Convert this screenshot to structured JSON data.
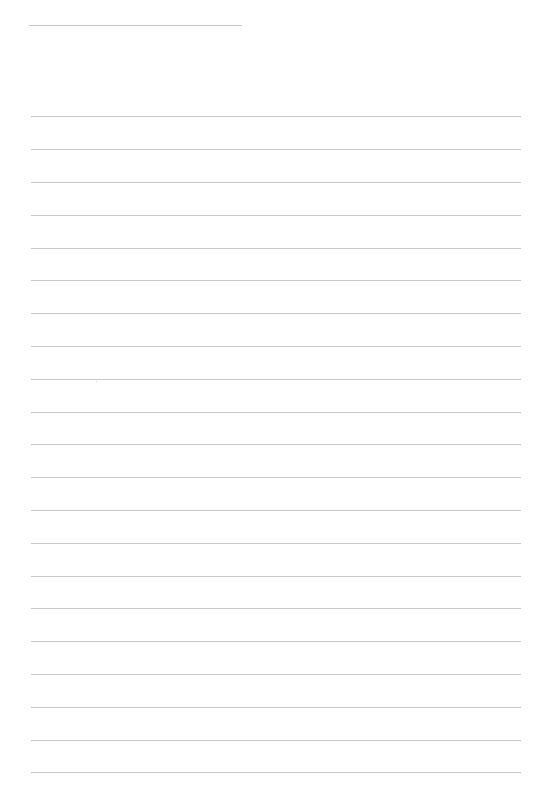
{
  "page": {
    "type": "lined-paper",
    "background_color": "#ffffff",
    "line_color": "#c8c8c8"
  },
  "title_rule": {
    "left": 29,
    "top": 25,
    "width": 213
  },
  "ruled_lines": {
    "left": 31,
    "width": 490,
    "count": 21,
    "positions": [
      116,
      149,
      182,
      215,
      248,
      280,
      313,
      346,
      379,
      412,
      444,
      477,
      510,
      543,
      576,
      608,
      641,
      674,
      707,
      740,
      772
    ]
  }
}
